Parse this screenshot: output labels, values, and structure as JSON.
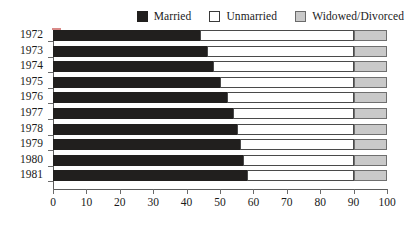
{
  "chart_data": {
    "type": "bar",
    "orientation": "horizontal",
    "stacked": true,
    "title": "",
    "subtitle": "",
    "xlabel": "",
    "ylabel": "",
    "xlim": [
      0,
      100
    ],
    "ylim": null,
    "grid": false,
    "legend_position": "top-right",
    "categories": [
      "1972",
      "1973",
      "1974",
      "1975",
      "1976",
      "1977",
      "1978",
      "1979",
      "1980",
      "1981"
    ],
    "xticks": [
      0,
      10,
      20,
      30,
      40,
      50,
      60,
      70,
      80,
      90,
      100
    ],
    "xtick_labels": [
      "0",
      "10",
      "20",
      "30",
      "40",
      "50",
      "60",
      "70",
      "80",
      "90",
      "100"
    ],
    "series": [
      {
        "name": "Married",
        "color": "#211f1e",
        "values": [
          44,
          46,
          48,
          50,
          52,
          54,
          55,
          56,
          57,
          58
        ]
      },
      {
        "name": "Unmarried",
        "color": "#ffffff",
        "values": [
          46,
          44,
          42,
          40,
          38,
          36,
          35,
          34,
          33,
          32
        ]
      },
      {
        "name": "Widowed/Divorced",
        "color": "#c9c9c9",
        "values": [
          10,
          10,
          10,
          10,
          10,
          10,
          10,
          10,
          10,
          10
        ]
      }
    ],
    "rows": [
      {
        "category": "1972",
        "married": 44,
        "unmarried": 46,
        "widowed_divorced": 10
      },
      {
        "category": "1973",
        "married": 46,
        "unmarried": 44,
        "widowed_divorced": 10
      },
      {
        "category": "1974",
        "married": 48,
        "unmarried": 42,
        "widowed_divorced": 10
      },
      {
        "category": "1975",
        "married": 50,
        "unmarried": 40,
        "widowed_divorced": 10
      },
      {
        "category": "1976",
        "married": 52,
        "unmarried": 38,
        "widowed_divorced": 10
      },
      {
        "category": "1977",
        "married": 54,
        "unmarried": 36,
        "widowed_divorced": 10
      },
      {
        "category": "1978",
        "married": 55,
        "unmarried": 35,
        "widowed_divorced": 10
      },
      {
        "category": "1979",
        "married": 56,
        "unmarried": 34,
        "widowed_divorced": 10
      },
      {
        "category": "1980",
        "married": 57,
        "unmarried": 33,
        "widowed_divorced": 10
      },
      {
        "category": "1981",
        "married": 58,
        "unmarried": 32,
        "widowed_divorced": 10
      }
    ]
  },
  "legend": {
    "items": [
      {
        "label": "Married",
        "swatch": "married-swatch",
        "color": "#211f1e"
      },
      {
        "label": "Unmarried",
        "swatch": "unmarried-swatch",
        "color": "#ffffff"
      },
      {
        "label": "Widowed/Divorced",
        "swatch": "widowed-divorced-swatch",
        "color": "#c9c9c9"
      }
    ]
  },
  "colors": {
    "married": "#211f1e",
    "unmarried": "#ffffff",
    "widowed_divorced": "#c9c9c9",
    "axis": "#5d5d5d",
    "text": "#1a1a1a"
  }
}
